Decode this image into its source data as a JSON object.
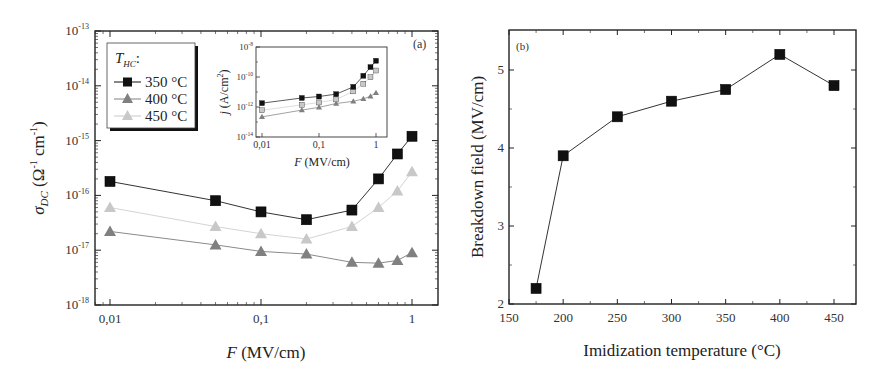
{
  "chart_data": [
    {
      "id": "a",
      "panel_label": "(a)",
      "type": "line",
      "xscale": "log",
      "yscale": "log",
      "xlabel": "F (MV/cm)",
      "ylabel": "σ_DC (Ω⁻¹ cm⁻¹)",
      "xlim": [
        0.008,
        1.2
      ],
      "ylim": [
        1e-18,
        1e-13
      ],
      "x_ticks": [
        "0,01",
        "0,1",
        "1"
      ],
      "y_ticks": [
        "10^-18",
        "10^-17",
        "10^-16",
        "10^-15",
        "10^-14",
        "10^-13"
      ],
      "legend": {
        "title": "T_HC:",
        "position": "upper-left",
        "entries": [
          "350 °C",
          "400 °C",
          "450 °C"
        ]
      },
      "series": [
        {
          "name": "350 °C",
          "marker": "square",
          "color": "#111111",
          "x": [
            0.01,
            0.05,
            0.1,
            0.2,
            0.4,
            0.6,
            0.8,
            1.0
          ],
          "y": [
            1.8e-16,
            8e-17,
            5e-17,
            3.6e-17,
            5.4e-17,
            2e-16,
            5.7e-16,
            1.2e-15
          ]
        },
        {
          "name": "400 °C",
          "marker": "triangle",
          "color": "#808080",
          "x": [
            0.01,
            0.05,
            0.1,
            0.2,
            0.4,
            0.6,
            0.8,
            1.0
          ],
          "y": [
            2.2e-17,
            1.25e-17,
            9.5e-18,
            8.5e-18,
            6e-18,
            5.8e-18,
            6.5e-18,
            9e-18
          ]
        },
        {
          "name": "450 °C",
          "marker": "triangle",
          "color": "#c8c8c8",
          "x": [
            0.01,
            0.05,
            0.1,
            0.2,
            0.4,
            0.6,
            0.8,
            1.0
          ],
          "y": [
            6e-17,
            2.7e-17,
            2e-17,
            1.6e-17,
            2.7e-17,
            6e-17,
            1.2e-16,
            2.7e-16
          ]
        }
      ],
      "inset": {
        "type": "line",
        "xscale": "log",
        "yscale": "log",
        "xlabel": "F (MV/cm)",
        "ylabel": "j (A/cm²)",
        "ylim": [
          1e-14,
          1e-08
        ],
        "x_ticks": [
          "0,01",
          "0,1",
          "1"
        ],
        "y_ticks": [
          "10^-14",
          "10^-12",
          "10^-10",
          "10^-8"
        ],
        "series": [
          {
            "name": "350 °C",
            "marker": "square",
            "color": "#111111",
            "x": [
              0.01,
              0.05,
              0.1,
              0.2,
              0.4,
              0.6,
              0.8,
              1.0
            ],
            "y": [
              1.8e-12,
              4e-12,
              5e-12,
              7.2e-12,
              2.2e-11,
              1.2e-10,
              4.6e-10,
              1.2e-09
            ]
          },
          {
            "name": "400 °C",
            "marker": "triangle",
            "color": "#808080",
            "x": [
              0.01,
              0.05,
              0.1,
              0.2,
              0.4,
              0.6,
              0.8,
              1.0
            ],
            "y": [
              2.2e-13,
              6.2e-13,
              9.5e-13,
              1.7e-12,
              2.4e-12,
              3.5e-12,
              5.2e-12,
              9e-12
            ]
          },
          {
            "name": "450 °C",
            "marker": "square",
            "color": "#c8c8c8",
            "x": [
              0.01,
              0.05,
              0.1,
              0.2,
              0.4,
              0.6,
              0.8,
              1.0
            ],
            "y": [
              6e-13,
              1.4e-12,
              2e-12,
              3.2e-12,
              1.1e-11,
              3.6e-11,
              9.6e-11,
              2.7e-10
            ]
          }
        ]
      }
    },
    {
      "id": "b",
      "panel_label": "(b)",
      "type": "line",
      "xlabel": "Imidization temperature (°C)",
      "ylabel": "Breakdown field (MV/cm)",
      "xlim": [
        150,
        470
      ],
      "ylim": [
        2,
        5.5
      ],
      "x_ticks": [
        "150",
        "200",
        "250",
        "300",
        "350",
        "400",
        "450"
      ],
      "y_ticks": [
        "2",
        "3",
        "4",
        "5"
      ],
      "grid": false,
      "series": [
        {
          "name": "Breakdown field",
          "marker": "square",
          "color": "#111111",
          "x": [
            175,
            200,
            250,
            300,
            350,
            400,
            450
          ],
          "y": [
            2.2,
            3.9,
            4.4,
            4.6,
            4.75,
            5.2,
            4.8
          ]
        }
      ]
    }
  ],
  "labels": {
    "a_panel": "(a)",
    "b_panel": "(b)",
    "a_xlabel_italic": "F",
    "a_xlabel_rest": " (MV/cm)",
    "a_ylabel_sigma": "σ",
    "a_ylabel_sub": "DC",
    "a_ylabel_rest": " (Ω",
    "a_ylabel_exp1": "-1",
    "a_ylabel_cm": " cm",
    "a_ylabel_exp2": "-1",
    "a_ylabel_close": ")",
    "legend_title_T": "T",
    "legend_title_sub": "HC",
    "legend_title_colon": ":",
    "legend_350": "350 °C",
    "legend_400": "400 °C",
    "legend_450": "450 °C",
    "inset_xlabel_italic": "F",
    "inset_xlabel_rest": " (MV/cm)",
    "inset_ylabel_j": "j",
    "inset_ylabel_rest": " (A/cm",
    "inset_ylabel_exp": "2",
    "inset_ylabel_close": ")",
    "b_xlabel": "Imidization temperature (°C)",
    "b_ylabel": "Breakdown field (MV/cm)"
  }
}
